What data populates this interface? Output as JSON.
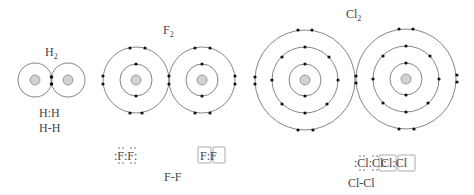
{
  "molecules": {
    "h2": {
      "title": "H",
      "subscript": "2",
      "lewis_dots": "H:H",
      "line_formula": "H-H"
    },
    "f2": {
      "title": "F",
      "subscript": "2",
      "lewis_dots": ":F̤̈:F̤̈:",
      "lewis_boxed": "F:F",
      "line_formula": "F-F"
    },
    "cl2": {
      "title": "Cl",
      "subscript": "2",
      "lewis_dots": ":C̤̈l:C̤̈l:",
      "lewis_boxed": "Cl:Cl",
      "line_formula": "Cl-Cl"
    }
  },
  "colors": {
    "shell": "#555555",
    "electron": "#111111",
    "nucleus_fill": "#d0d0d0",
    "nucleus_stroke": "#777777",
    "text": "#444444"
  }
}
